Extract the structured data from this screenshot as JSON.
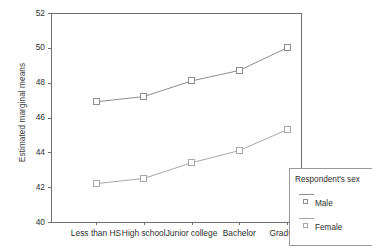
{
  "chart_data": {
    "type": "line",
    "title": "",
    "subtitle": "",
    "xlabel": "",
    "ylabel": "Estimated marginal means",
    "categories": [
      "Less than HS",
      "High school",
      "Junior college",
      "Bachelor",
      "Graduate"
    ],
    "series": [
      {
        "name": "Male",
        "values": [
          46.9,
          47.2,
          48.1,
          48.7,
          50.0
        ],
        "marker": "open-square",
        "color": "#8d8d8d"
      },
      {
        "name": "Female",
        "values": [
          42.2,
          42.5,
          43.4,
          44.1,
          45.3
        ],
        "marker": "open-square",
        "color": "#a8a8a8"
      }
    ],
    "ylim": [
      40,
      52
    ],
    "yticks": [
      "40",
      "42",
      "44",
      "46",
      "48",
      "50",
      "52"
    ],
    "ytick_values": [
      40,
      42,
      44,
      46,
      48,
      50,
      52
    ],
    "grid": false,
    "legend": {
      "title": "Respondent's sex",
      "position": "bottom-right",
      "entries": [
        "Male",
        "Female"
      ]
    }
  },
  "colors": {
    "axis": "#6f6f6f",
    "male_line": "#8d8d8d",
    "female_line": "#a8a8a8",
    "text": "#2f2f2f",
    "background": "#ffffff"
  }
}
